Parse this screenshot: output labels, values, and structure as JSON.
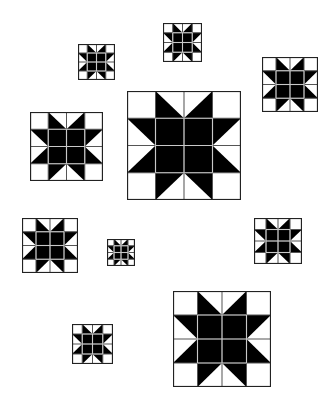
{
  "canvas": {
    "width": 328,
    "height": 414,
    "background": "#ffffff"
  },
  "colors": {
    "ink": "#000000",
    "paper": "#ffffff",
    "grid_line_on_black": "#c8c8c8",
    "grid_line_on_white": "#555555"
  },
  "pattern": {
    "name": "sawtooth-star-quilt-block",
    "grid": 4,
    "cells": [
      [
        "white",
        "black-lower-left",
        "black-lower-right",
        "white"
      ],
      [
        "black-upper-right",
        "black",
        "black",
        "black-upper-left"
      ],
      [
        "black-lower-right",
        "black",
        "black",
        "black-lower-left"
      ],
      [
        "white",
        "black-upper-left",
        "black-upper-right",
        "white"
      ]
    ]
  },
  "blocks": [
    {
      "id": "block-top-left-small",
      "x": 78,
      "y": 44,
      "w": 37,
      "h": 36
    },
    {
      "id": "block-top-center-small",
      "x": 163,
      "y": 23,
      "w": 39,
      "h": 39
    },
    {
      "id": "block-top-right",
      "x": 262,
      "y": 57,
      "w": 56,
      "h": 55
    },
    {
      "id": "block-mid-left",
      "x": 30,
      "y": 112,
      "w": 73,
      "h": 69
    },
    {
      "id": "block-center-large",
      "x": 127,
      "y": 91,
      "w": 114,
      "h": 109
    },
    {
      "id": "block-lower-left",
      "x": 22,
      "y": 218,
      "w": 56,
      "h": 55
    },
    {
      "id": "block-tiny",
      "x": 107,
      "y": 239,
      "w": 28,
      "h": 27
    },
    {
      "id": "block-lower-right",
      "x": 254,
      "y": 218,
      "w": 48,
      "h": 46
    },
    {
      "id": "block-bottom-large",
      "x": 173,
      "y": 291,
      "w": 98,
      "h": 96
    },
    {
      "id": "block-bottom-left-small",
      "x": 72,
      "y": 324,
      "w": 41,
      "h": 40
    }
  ]
}
